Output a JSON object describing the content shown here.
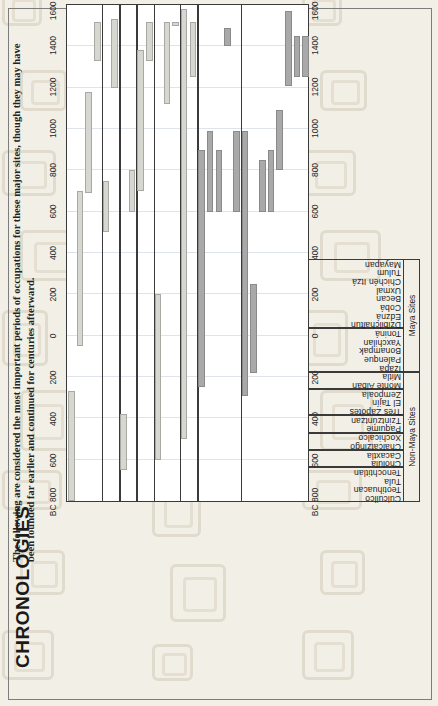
{
  "header": {
    "title": "CHRONOLOGIES",
    "subtitle": "The following are considered the most important periods of occupations for these major sites, though they may have been founded far earlier and continued for centuries afterward."
  },
  "axis": {
    "label_left": "BC 800",
    "label_right": "1600 AD",
    "ticks": [
      "BC 800",
      "600",
      "400",
      "200",
      "0",
      "200",
      "400",
      "600",
      "800",
      "1000",
      "1200",
      "1400",
      "1600 AD"
    ],
    "min": -800,
    "max": 1600
  },
  "groups": [
    {
      "name": "Non-Maya Sites",
      "color": "#d7d7d2"
    },
    {
      "name": "Maya Sites",
      "color": "#a9a9a9"
    }
  ],
  "chart_data": {
    "type": "bar",
    "title": "CHRONOLOGIES",
    "subtitle": "The following are considered the most important periods of occupations for these major sites, though they may have been founded far earlier and continued for centuries afterward.",
    "xlabel": "",
    "ylabel": "",
    "orientation": "horizontal-range",
    "xlim": [
      -800,
      1600
    ],
    "grid": true,
    "legend": false,
    "categories": [
      "Cuicuilco",
      "Teotihuacan",
      "Tula",
      "Tenochtitlan",
      "Cholula",
      "Cacaxtla",
      "Chalcatzingo",
      "Xochicalco",
      "Paquimé",
      "Tzintzúntzan",
      "Tres Zapotes",
      "El Tajín",
      "Zempoala",
      "Monte Albán",
      "Mitla",
      "Izapa",
      "Palenque",
      "Bonampak",
      "Yaxchilan",
      "Toniná",
      "Dzibilchaltun",
      "Edzná",
      "Cobá",
      "Becan",
      "Uxmal",
      "Chichén Itzá",
      "Tulum",
      "Mayapan"
    ],
    "series": [
      {
        "name": "Non-Maya Sites",
        "color": "#d7d7d2",
        "ranges": [
          {
            "site": "Cuicuilco",
            "group": 1,
            "start": -800,
            "end": -270
          },
          {
            "site": "Teotihuacan",
            "group": 1,
            "start": -50,
            "end": 700
          },
          {
            "site": "Tula",
            "group": 1,
            "start": 690,
            "end": 1180
          },
          {
            "site": "Tenochtitlan",
            "group": 1,
            "start": 1330,
            "end": 1520
          },
          {
            "site": "Cholula",
            "group": 2,
            "start": 500,
            "end": 750
          },
          {
            "site": "Cacaxtla",
            "group": 2,
            "start": 1200,
            "end": 1530
          },
          {
            "site": "Chalcatzingo",
            "group": 3,
            "start": -650,
            "end": -380
          },
          {
            "site": "Xochicalco",
            "group": 3,
            "start": 600,
            "end": 800
          },
          {
            "site": "Paquimé",
            "group": 4,
            "start": 700,
            "end": 1380
          },
          {
            "site": "Tzintzúntzan",
            "group": 4,
            "start": 1330,
            "end": 1520
          },
          {
            "site": "Tres Zapotes",
            "group": 5,
            "start": -600,
            "end": 200
          },
          {
            "site": "El Tajín",
            "group": 5,
            "start": 1120,
            "end": 1520
          },
          {
            "site": "Zempoala",
            "group": 5,
            "start": 1500,
            "end": 1520
          },
          {
            "site": "Monte Albán",
            "group": 6,
            "start": -500,
            "end": 1580
          },
          {
            "site": "Mitla",
            "group": 6,
            "start": 1250,
            "end": 1520
          }
        ]
      },
      {
        "name": "Maya Sites",
        "color": "#a9a9a9",
        "ranges": [
          {
            "site": "Izapa",
            "group": 7,
            "start": -250,
            "end": 900
          },
          {
            "site": "Palenque",
            "group": 7,
            "start": 600,
            "end": 990
          },
          {
            "site": "Bonampak",
            "group": 7,
            "start": 600,
            "end": 900
          },
          {
            "site": "Yaxchilan",
            "group": 7,
            "start": 1400,
            "end": 1490
          },
          {
            "site": "Toniná",
            "group": 7,
            "start": 600,
            "end": 990
          },
          {
            "site": "Dzibilchaltun",
            "group": 8,
            "start": -290,
            "end": 990
          },
          {
            "site": "Edzná",
            "group": 8,
            "start": -180,
            "end": 250
          },
          {
            "site": "Cobá",
            "group": 8,
            "start": 600,
            "end": 850
          },
          {
            "site": "Becan",
            "group": 8,
            "start": 600,
            "end": 900
          },
          {
            "site": "Uxmal",
            "group": 8,
            "start": 800,
            "end": 1090
          },
          {
            "site": "Chichén Itzá",
            "group": 8,
            "start": 1210,
            "end": 1570
          },
          {
            "site": "Tulum",
            "group": 8,
            "start": 1250,
            "end": 1450
          },
          {
            "site": "Mayapan",
            "group": 8,
            "start": 1250,
            "end": 1450
          }
        ]
      }
    ]
  }
}
